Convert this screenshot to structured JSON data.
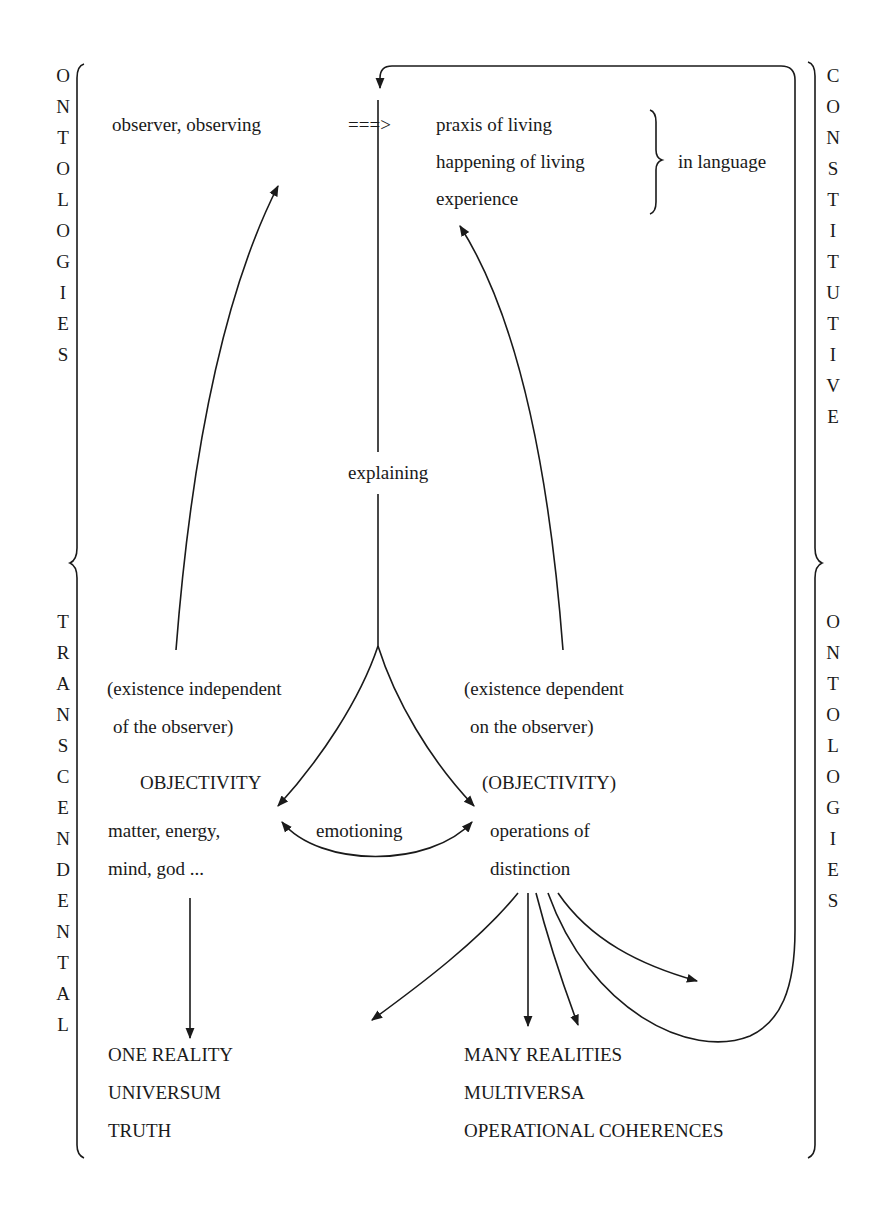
{
  "side_labels": {
    "left_top": [
      "O",
      "N",
      "T",
      "O",
      "L",
      "O",
      "G",
      "I",
      "E",
      "S"
    ],
    "left_bottom": [
      "T",
      "R",
      "A",
      "N",
      "S",
      "C",
      "E",
      "N",
      "D",
      "E",
      "N",
      "T",
      "A",
      "L"
    ],
    "right_top": [
      "C",
      "O",
      "N",
      "S",
      "T",
      "I",
      "T",
      "U",
      "T",
      "I",
      "V",
      "E"
    ],
    "right_bottom": [
      "O",
      "N",
      "T",
      "O",
      "L",
      "O",
      "G",
      "I",
      "E",
      "S"
    ],
    "left_top_word": "ONTOLOGIES",
    "left_bottom_word": "TRANSCENDENTAL",
    "right_top_word": "CONSTITUTIVE",
    "right_bottom_word": "ONTOLOGIES"
  },
  "top": {
    "observer": "observer, observing",
    "arrow": "===>",
    "praxis": "praxis of living",
    "happening": "happening of living",
    "experience": "experience",
    "in_language": "in language"
  },
  "center": {
    "explaining": "explaining",
    "emotioning": "emotioning"
  },
  "left_branch": {
    "existence_line1": "(existence independent",
    "existence_line2": "of the observer)",
    "objectivity": "OBJECTIVITY",
    "matter_line1": "matter, energy,",
    "matter_line2": "mind, god ...",
    "result": [
      "ONE REALITY",
      "UNIVERSUM",
      "TRUTH"
    ]
  },
  "right_branch": {
    "existence_line1": "(existence dependent",
    "existence_line2": "on the observer)",
    "objectivity": "(OBJECTIVITY)",
    "operations_line1": "operations of",
    "operations_line2": "distinction",
    "result": [
      "MANY REALITIES",
      "MULTIVERSA",
      "OPERATIONAL COHERENCES"
    ]
  },
  "colors": {
    "ink": "#1a1a1a",
    "background": "#ffffff"
  }
}
